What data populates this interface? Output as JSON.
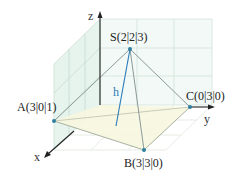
{
  "diagram": {
    "type": "3d-pyramid-coordinate-system",
    "axes": {
      "x": "x",
      "y": "y",
      "z": "z"
    },
    "points": {
      "S": "S(2|2|3)",
      "A": "A(3|0|1)",
      "B": "B(3|3|0)",
      "C": "C(0|3|0)"
    },
    "height_label": "h",
    "colors": {
      "axis": "#222222",
      "grid": "#c9d6d0",
      "xz_plane_fill": "#e3f3ec",
      "base_fill": "#f7f6df",
      "edges": "#8c9a9a",
      "height": "#2a7ab8",
      "points": "#2f7fa0"
    }
  }
}
